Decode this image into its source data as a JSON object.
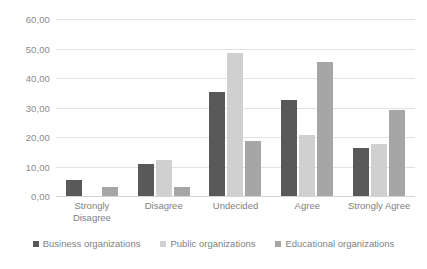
{
  "chart_data": {
    "type": "bar",
    "title": "",
    "subtitle": "",
    "xlabel": "",
    "ylabel": "",
    "ylim": [
      0,
      60
    ],
    "ytick_step": 10,
    "ytick_labels": [
      "0,00",
      "10,00",
      "20,00",
      "30,00",
      "40,00",
      "50,00",
      "60,00"
    ],
    "ytick_values": [
      0,
      10,
      20,
      30,
      40,
      50,
      60
    ],
    "grid": true,
    "legend_position": "bottom",
    "categories": [
      "Strongly\nDisagree",
      "Disagree",
      "Undecided",
      "Agree",
      "Strongly Agree"
    ],
    "series": [
      {
        "name": "Business organizations",
        "color": "#595959",
        "values": [
          5.4,
          10.8,
          35.1,
          32.4,
          16.2
        ]
      },
      {
        "name": "Public organizations",
        "color": "#d0d0d0",
        "values": [
          0,
          12.2,
          48.5,
          20.8,
          17.8
        ]
      },
      {
        "name": "Educational organizations",
        "color": "#a6a6a6",
        "values": [
          2.9,
          2.9,
          18.7,
          45.5,
          29.1
        ]
      }
    ]
  }
}
